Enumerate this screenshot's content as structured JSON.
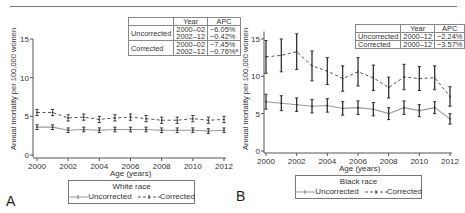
{
  "panels": [
    {
      "letter": "A",
      "legend_title": "White race",
      "legend_items": [
        "Uncorrected",
        "Corrected"
      ],
      "xlabel": "Age (years)",
      "ylabel": "Annual mortality per 100,000 women",
      "apc_table": {
        "headers": [
          "",
          "Year",
          "APC"
        ],
        "rows": [
          {
            "group": "Uncorrected",
            "years": [
              "2000–02",
              "2002–12"
            ],
            "apc": [
              "−6.05%",
              "−0.42%"
            ]
          },
          {
            "group": "Corrected",
            "years": [
              "2000–02",
              "2002–12"
            ],
            "apc": [
              "−7.45%",
              "−0.76%ᵃ"
            ]
          }
        ]
      }
    },
    {
      "letter": "B",
      "legend_title": "Black race",
      "legend_items": [
        "Uncorrected",
        "Corrected"
      ],
      "xlabel": "Age (years)",
      "ylabel": "Annual mortality per 100,000 women",
      "apc_table": {
        "headers": [
          "",
          "Year",
          "APC"
        ],
        "rows": [
          {
            "group": "Uncorrected",
            "years": [
              "2000–12"
            ],
            "apc": [
              "−2.24%"
            ]
          },
          {
            "group": "Corrected",
            "years": [
              "2000–12"
            ],
            "apc": [
              "−3.57%"
            ]
          }
        ]
      }
    }
  ],
  "colors": {
    "uncorrected": "#999999",
    "corrected": "#555555",
    "errorbar": "#333333",
    "axis": "#555555"
  },
  "chart_data": [
    {
      "type": "line",
      "title": "A — White race",
      "xlabel": "Age (years)",
      "ylabel": "Annual mortality per 100,000 women",
      "x": [
        2000,
        2001,
        2002,
        2003,
        2004,
        2005,
        2006,
        2007,
        2008,
        2009,
        2010,
        2011,
        2012
      ],
      "xticks": [
        2000,
        2002,
        2004,
        2006,
        2008,
        2010,
        2012
      ],
      "yticks": [
        0,
        5,
        10,
        15
      ],
      "ylim": [
        0,
        15
      ],
      "legend_position": "bottom",
      "grid": false,
      "series": [
        {
          "name": "Uncorrected",
          "style": "solid",
          "values": [
            3.6,
            3.6,
            3.2,
            3.3,
            3.2,
            3.3,
            3.3,
            3.3,
            3.2,
            3.2,
            3.2,
            3.1,
            3.2
          ],
          "error": [
            0.3,
            0.3,
            0.3,
            0.3,
            0.3,
            0.3,
            0.3,
            0.3,
            0.3,
            0.3,
            0.3,
            0.3,
            0.3
          ]
        },
        {
          "name": "Corrected",
          "style": "dashed",
          "values": [
            5.5,
            5.5,
            4.8,
            4.9,
            4.6,
            4.8,
            4.9,
            4.7,
            4.5,
            4.5,
            4.7,
            4.5,
            4.6
          ],
          "error": [
            0.4,
            0.4,
            0.4,
            0.4,
            0.4,
            0.4,
            0.4,
            0.4,
            0.4,
            0.4,
            0.4,
            0.4,
            0.4
          ]
        }
      ],
      "annotations": {
        "apc_table": [
          {
            "group": "Uncorrected",
            "period": "2000–02",
            "apc": "−6.05%"
          },
          {
            "group": "Uncorrected",
            "period": "2002–12",
            "apc": "−0.42%"
          },
          {
            "group": "Corrected",
            "period": "2000–02",
            "apc": "−7.45%"
          },
          {
            "group": "Corrected",
            "period": "2002–12",
            "apc": "−0.76%ᵃ"
          }
        ]
      }
    },
    {
      "type": "line",
      "title": "B — Black race",
      "xlabel": "Age (years)",
      "ylabel": "Annual mortality per 100,000 women",
      "x": [
        2000,
        2001,
        2002,
        2003,
        2004,
        2005,
        2006,
        2007,
        2008,
        2009,
        2010,
        2011,
        2012
      ],
      "xticks": [
        2000,
        2002,
        2004,
        2006,
        2008,
        2010,
        2012
      ],
      "yticks": [
        0,
        5,
        10,
        15
      ],
      "ylim": [
        0,
        16
      ],
      "legend_position": "bottom",
      "grid": false,
      "series": [
        {
          "name": "Uncorrected",
          "style": "solid",
          "values": [
            6.6,
            6.4,
            6.2,
            6.0,
            6.1,
            5.7,
            5.8,
            5.6,
            5.0,
            5.8,
            5.4,
            5.8,
            4.3
          ],
          "error": [
            1.0,
            1.0,
            0.9,
            0.9,
            0.9,
            0.9,
            0.9,
            0.9,
            0.8,
            0.9,
            0.8,
            0.8,
            0.7
          ]
        },
        {
          "name": "Corrected",
          "style": "dashed",
          "values": [
            12.6,
            12.8,
            13.3,
            11.4,
            10.7,
            9.7,
            10.6,
            9.8,
            8.5,
            9.9,
            9.7,
            9.8,
            7.3
          ],
          "error": [
            2.2,
            2.2,
            2.4,
            2.0,
            1.8,
            1.7,
            1.9,
            1.7,
            1.4,
            1.7,
            1.6,
            1.6,
            1.3
          ]
        }
      ],
      "annotations": {
        "apc_table": [
          {
            "group": "Uncorrected",
            "period": "2000–12",
            "apc": "−2.24%"
          },
          {
            "group": "Corrected",
            "period": "2000–12",
            "apc": "−3.57%"
          }
        ]
      }
    }
  ]
}
